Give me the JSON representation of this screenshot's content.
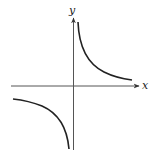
{
  "diagram": {
    "type": "function-graph",
    "function": "y = 1/x",
    "axes": {
      "x_label": "x",
      "y_label": "y"
    },
    "colors": {
      "axis": "#444444",
      "curve": "#222222",
      "background": "#ffffff"
    }
  }
}
